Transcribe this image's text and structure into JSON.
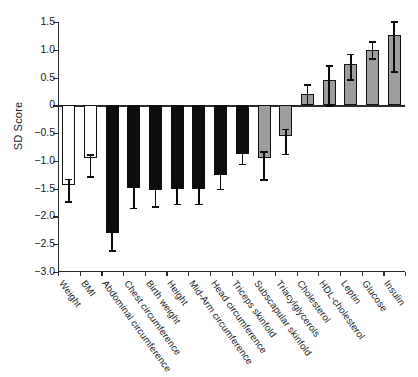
{
  "chart_data": {
    "type": "bar",
    "title": "",
    "xlabel": "",
    "ylabel": "SD Score",
    "ylim": [
      -3.0,
      1.5
    ],
    "yticks": [
      1.5,
      1.0,
      0.5,
      0,
      -0.5,
      -1.0,
      -1.5,
      -2.0,
      -2.5,
      -3.0
    ],
    "ytick_labels": [
      "1.5",
      "1.0",
      "0.5",
      "0",
      "−0.5",
      "−1.0",
      "−1.5",
      "−2.0",
      "−2.5",
      "−3.0"
    ],
    "grid": false,
    "legend": false,
    "categories": [
      "Weight",
      "BMI",
      "Abdominal circumference",
      "Chest circumference",
      "Birth weight",
      "Height",
      "Mid-Arm circumference",
      "Head circumference",
      "Triceps skinfold",
      "Subscapular skinfold",
      "Triacylglycerols",
      "Cholesterol",
      "HDL-cholesterol",
      "Leptin",
      "Glucose",
      "Insulin"
    ],
    "values": [
      -1.43,
      -0.95,
      -2.3,
      -1.48,
      -1.52,
      -1.5,
      -1.5,
      -1.25,
      -0.88,
      -0.95,
      -0.55,
      0.2,
      0.45,
      0.75,
      1.0,
      1.27
    ],
    "err_low": [
      -1.73,
      -1.27,
      -2.6,
      -1.84,
      -1.81,
      -1.77,
      -1.77,
      -1.5,
      -1.05,
      -1.33,
      -0.87,
      0.03,
      0.0,
      0.47,
      0.85,
      0.62
    ],
    "err_high": [
      -1.32,
      -0.88,
      -2.18,
      -1.35,
      -1.37,
      -1.37,
      -1.37,
      -1.16,
      -0.74,
      -0.82,
      -0.42,
      0.38,
      0.73,
      0.93,
      1.15,
      1.52
    ],
    "bar_styles": [
      "white",
      "white",
      "black",
      "black",
      "black",
      "black",
      "black",
      "black",
      "black",
      "gray",
      "gray",
      "gray",
      "gray",
      "gray",
      "gray",
      "gray"
    ],
    "colors": {
      "white": "#ffffff",
      "black": "#0d0d0d",
      "gray": "#9d9d9d",
      "axis": "#2b2b2b",
      "text": "#1a1a1a"
    }
  }
}
